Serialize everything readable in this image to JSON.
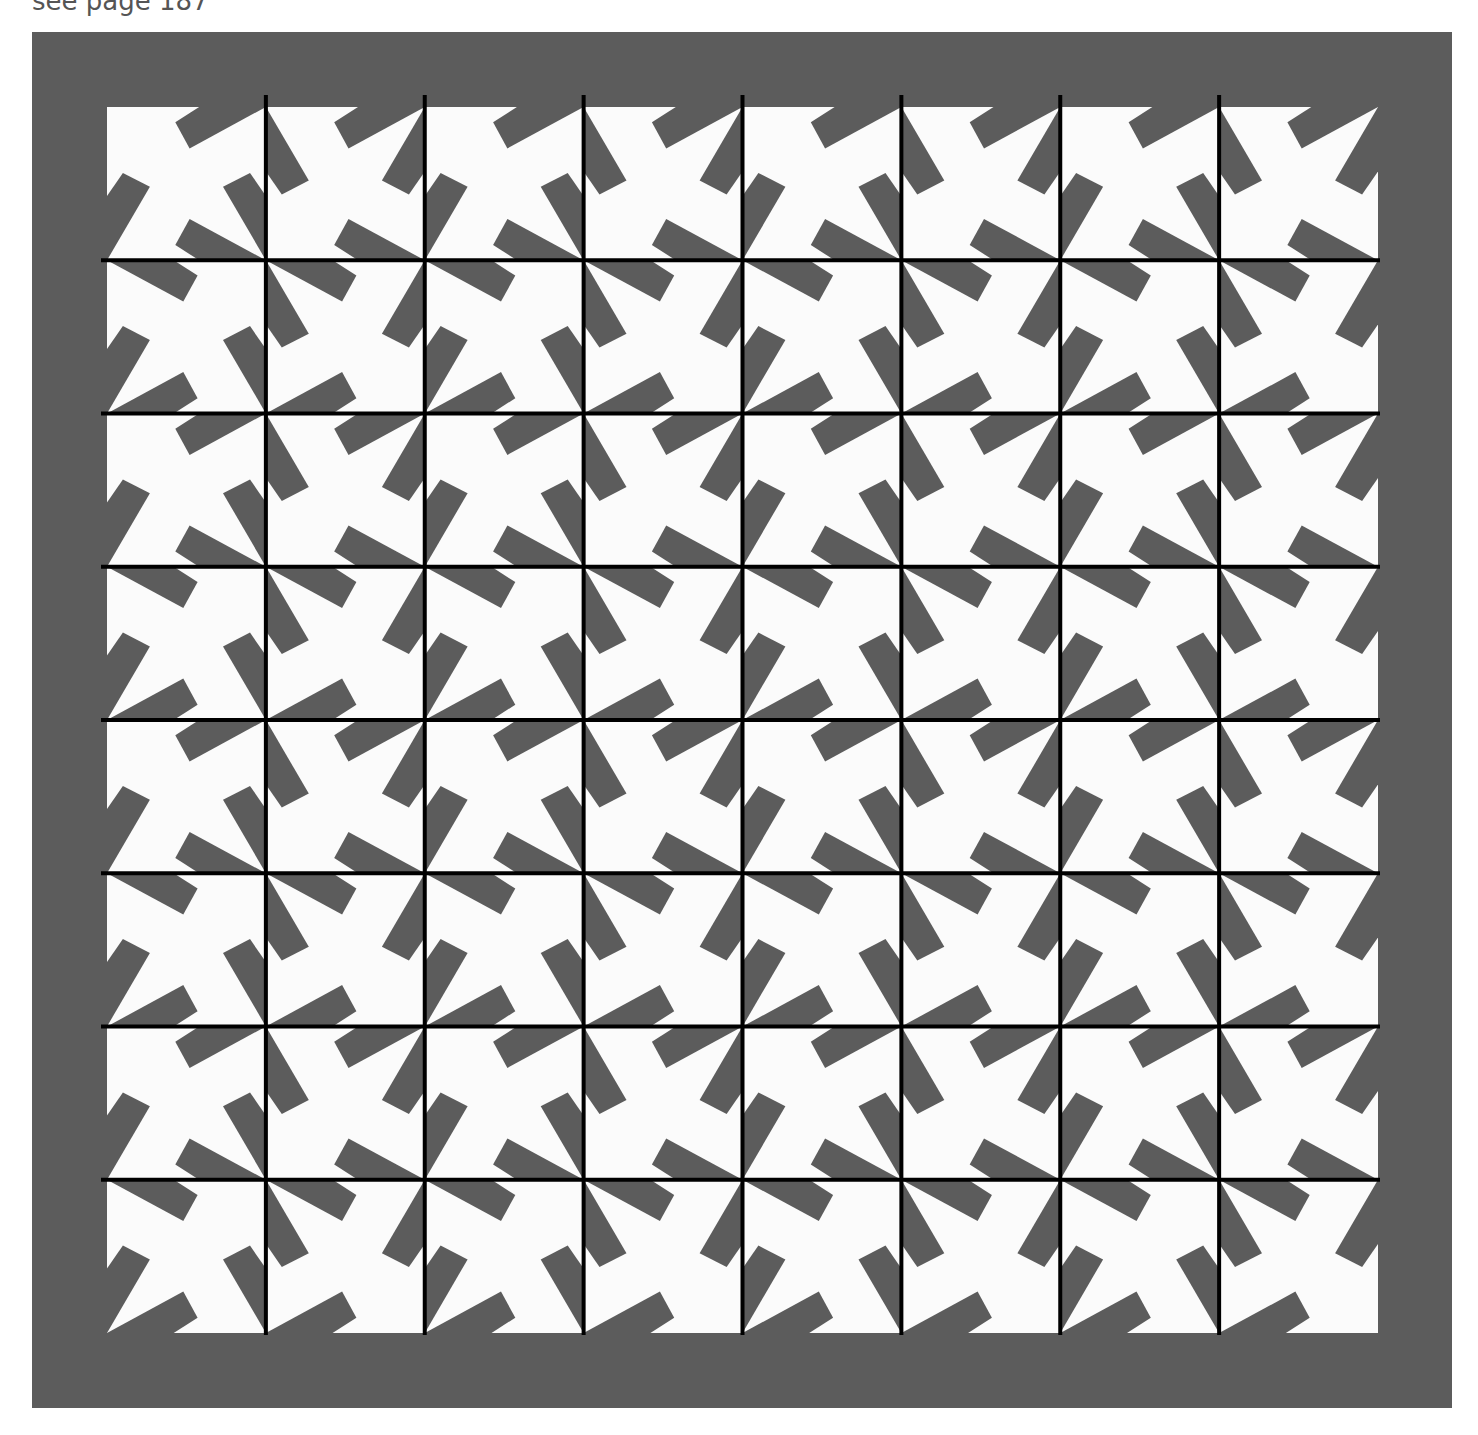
{
  "caption": "see page 187",
  "figure": {
    "frame_color": "#5c5c5c",
    "tile_color": "#fbfbfb",
    "blade_color": "#5c5c5c",
    "grid_line_color": "#000000",
    "grid_line_width": 4,
    "area": {
      "x": 107,
      "y": 107,
      "width": 1271,
      "height": 1226
    },
    "rows": 8,
    "cols": 8,
    "blade_shape": {
      "description": "quadrilateral blade lying along one cell edge; s = fraction along edge from tip corner, d = fraction inward",
      "points": [
        {
          "s": 0.0,
          "d": 0.0
        },
        {
          "s": 0.42,
          "d": 0.0
        },
        {
          "s": 0.57,
          "d": 0.1
        },
        {
          "s": 0.48,
          "d": 0.27
        }
      ]
    },
    "cells": [
      {
        "row": 0,
        "col": 0,
        "top": "R",
        "right": "B",
        "bottom": "R",
        "left": "B"
      },
      {
        "row": 0,
        "col": 1,
        "top": "R",
        "right": "T",
        "bottom": "R",
        "left": "T"
      },
      {
        "row": 0,
        "col": 2,
        "top": "R",
        "right": "B",
        "bottom": "R",
        "left": "B"
      },
      {
        "row": 0,
        "col": 3,
        "top": "R",
        "right": "T",
        "bottom": "R",
        "left": "T"
      },
      {
        "row": 0,
        "col": 4,
        "top": "R",
        "right": "B",
        "bottom": "R",
        "left": "B"
      },
      {
        "row": 0,
        "col": 5,
        "top": "R",
        "right": "T",
        "bottom": "R",
        "left": "T"
      },
      {
        "row": 0,
        "col": 6,
        "top": "R",
        "right": "B",
        "bottom": "R",
        "left": "B"
      },
      {
        "row": 0,
        "col": 7,
        "top": "R",
        "right": "T",
        "bottom": "R",
        "left": "T"
      },
      {
        "row": 1,
        "col": 0,
        "top": "L",
        "right": "B",
        "bottom": "L",
        "left": "B"
      },
      {
        "row": 1,
        "col": 1,
        "top": "L",
        "right": "T",
        "bottom": "L",
        "left": "T"
      },
      {
        "row": 1,
        "col": 2,
        "top": "L",
        "right": "B",
        "bottom": "L",
        "left": "B"
      },
      {
        "row": 1,
        "col": 3,
        "top": "L",
        "right": "T",
        "bottom": "L",
        "left": "T"
      },
      {
        "row": 1,
        "col": 4,
        "top": "L",
        "right": "B",
        "bottom": "L",
        "left": "B"
      },
      {
        "row": 1,
        "col": 5,
        "top": "L",
        "right": "T",
        "bottom": "L",
        "left": "T"
      },
      {
        "row": 1,
        "col": 6,
        "top": "L",
        "right": "B",
        "bottom": "L",
        "left": "B"
      },
      {
        "row": 1,
        "col": 7,
        "top": "L",
        "right": "T",
        "bottom": "L",
        "left": "T"
      },
      {
        "row": 2,
        "col": 0,
        "top": "R",
        "right": "B",
        "bottom": "R",
        "left": "B"
      },
      {
        "row": 2,
        "col": 1,
        "top": "R",
        "right": "T",
        "bottom": "R",
        "left": "T"
      },
      {
        "row": 2,
        "col": 2,
        "top": "R",
        "right": "B",
        "bottom": "R",
        "left": "B"
      },
      {
        "row": 2,
        "col": 3,
        "top": "R",
        "right": "T",
        "bottom": "R",
        "left": "T"
      },
      {
        "row": 2,
        "col": 4,
        "top": "R",
        "right": "B",
        "bottom": "R",
        "left": "B"
      },
      {
        "row": 2,
        "col": 5,
        "top": "R",
        "right": "T",
        "bottom": "R",
        "left": "T"
      },
      {
        "row": 2,
        "col": 6,
        "top": "R",
        "right": "B",
        "bottom": "R",
        "left": "B"
      },
      {
        "row": 2,
        "col": 7,
        "top": "R",
        "right": "T",
        "bottom": "R",
        "left": "T"
      },
      {
        "row": 3,
        "col": 0,
        "top": "L",
        "right": "B",
        "bottom": "L",
        "left": "B"
      },
      {
        "row": 3,
        "col": 1,
        "top": "L",
        "right": "T",
        "bottom": "L",
        "left": "T"
      },
      {
        "row": 3,
        "col": 2,
        "top": "L",
        "right": "B",
        "bottom": "L",
        "left": "B"
      },
      {
        "row": 3,
        "col": 3,
        "top": "L",
        "right": "T",
        "bottom": "L",
        "left": "T"
      },
      {
        "row": 3,
        "col": 4,
        "top": "L",
        "right": "B",
        "bottom": "L",
        "left": "B"
      },
      {
        "row": 3,
        "col": 5,
        "top": "L",
        "right": "T",
        "bottom": "L",
        "left": "T"
      },
      {
        "row": 3,
        "col": 6,
        "top": "L",
        "right": "B",
        "bottom": "L",
        "left": "B"
      },
      {
        "row": 3,
        "col": 7,
        "top": "L",
        "right": "T",
        "bottom": "L",
        "left": "T"
      },
      {
        "row": 4,
        "col": 0,
        "top": "R",
        "right": "B",
        "bottom": "R",
        "left": "B"
      },
      {
        "row": 4,
        "col": 1,
        "top": "R",
        "right": "T",
        "bottom": "R",
        "left": "T"
      },
      {
        "row": 4,
        "col": 2,
        "top": "R",
        "right": "B",
        "bottom": "R",
        "left": "B"
      },
      {
        "row": 4,
        "col": 3,
        "top": "R",
        "right": "T",
        "bottom": "R",
        "left": "T"
      },
      {
        "row": 4,
        "col": 4,
        "top": "R",
        "right": "B",
        "bottom": "R",
        "left": "B"
      },
      {
        "row": 4,
        "col": 5,
        "top": "R",
        "right": "T",
        "bottom": "R",
        "left": "T"
      },
      {
        "row": 4,
        "col": 6,
        "top": "R",
        "right": "B",
        "bottom": "R",
        "left": "B"
      },
      {
        "row": 4,
        "col": 7,
        "top": "R",
        "right": "T",
        "bottom": "R",
        "left": "T"
      },
      {
        "row": 5,
        "col": 0,
        "top": "L",
        "right": "B",
        "bottom": "L",
        "left": "B"
      },
      {
        "row": 5,
        "col": 1,
        "top": "L",
        "right": "T",
        "bottom": "L",
        "left": "T"
      },
      {
        "row": 5,
        "col": 2,
        "top": "L",
        "right": "B",
        "bottom": "L",
        "left": "B"
      },
      {
        "row": 5,
        "col": 3,
        "top": "L",
        "right": "T",
        "bottom": "L",
        "left": "T"
      },
      {
        "row": 5,
        "col": 4,
        "top": "L",
        "right": "B",
        "bottom": "L",
        "left": "B"
      },
      {
        "row": 5,
        "col": 5,
        "top": "L",
        "right": "T",
        "bottom": "L",
        "left": "T"
      },
      {
        "row": 5,
        "col": 6,
        "top": "L",
        "right": "B",
        "bottom": "L",
        "left": "B"
      },
      {
        "row": 5,
        "col": 7,
        "top": "L",
        "right": "T",
        "bottom": "L",
        "left": "T"
      },
      {
        "row": 6,
        "col": 0,
        "top": "R",
        "right": "B",
        "bottom": "R",
        "left": "B"
      },
      {
        "row": 6,
        "col": 1,
        "top": "R",
        "right": "T",
        "bottom": "R",
        "left": "T"
      },
      {
        "row": 6,
        "col": 2,
        "top": "R",
        "right": "B",
        "bottom": "R",
        "left": "B"
      },
      {
        "row": 6,
        "col": 3,
        "top": "R",
        "right": "T",
        "bottom": "R",
        "left": "T"
      },
      {
        "row": 6,
        "col": 4,
        "top": "R",
        "right": "B",
        "bottom": "R",
        "left": "B"
      },
      {
        "row": 6,
        "col": 5,
        "top": "R",
        "right": "T",
        "bottom": "R",
        "left": "T"
      },
      {
        "row": 6,
        "col": 6,
        "top": "R",
        "right": "B",
        "bottom": "R",
        "left": "B"
      },
      {
        "row": 6,
        "col": 7,
        "top": "R",
        "right": "T",
        "bottom": "R",
        "left": "T"
      },
      {
        "row": 7,
        "col": 0,
        "top": "L",
        "right": "B",
        "bottom": "L",
        "left": "B"
      },
      {
        "row": 7,
        "col": 1,
        "top": "L",
        "right": "T",
        "bottom": "L",
        "left": "T"
      },
      {
        "row": 7,
        "col": 2,
        "top": "L",
        "right": "B",
        "bottom": "L",
        "left": "B"
      },
      {
        "row": 7,
        "col": 3,
        "top": "L",
        "right": "T",
        "bottom": "L",
        "left": "T"
      },
      {
        "row": 7,
        "col": 4,
        "top": "L",
        "right": "B",
        "bottom": "L",
        "left": "B"
      },
      {
        "row": 7,
        "col": 5,
        "top": "L",
        "right": "T",
        "bottom": "L",
        "left": "T"
      },
      {
        "row": 7,
        "col": 6,
        "top": "L",
        "right": "B",
        "bottom": "L",
        "left": "B"
      },
      {
        "row": 7,
        "col": 7,
        "top": "L",
        "right": "T",
        "bottom": "L",
        "left": "T"
      }
    ]
  }
}
